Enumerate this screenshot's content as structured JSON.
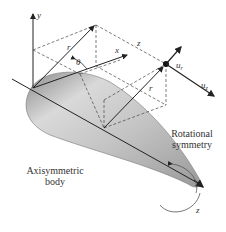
{
  "diagram": {
    "axis_labels": {
      "y": "y",
      "x": "x",
      "z_top": "z",
      "z_bottom": "z"
    },
    "vector_labels": {
      "r_left": "r",
      "r_right": "r",
      "theta": "θ",
      "u_r": "u",
      "u_r_sub": "r",
      "u_z": "u",
      "u_z_sub": "z"
    },
    "captions": {
      "body_line1": "Axisymmetric",
      "body_line2": "body",
      "symmetry_line1": "Rotational",
      "symmetry_line2": "symmetry"
    },
    "colors": {
      "line": "#222222",
      "dash": "#444444",
      "body_light": "#e6e6e6",
      "body_mid": "#b8b8b8",
      "body_dark": "#7a7a7a",
      "text": "#333333"
    }
  }
}
